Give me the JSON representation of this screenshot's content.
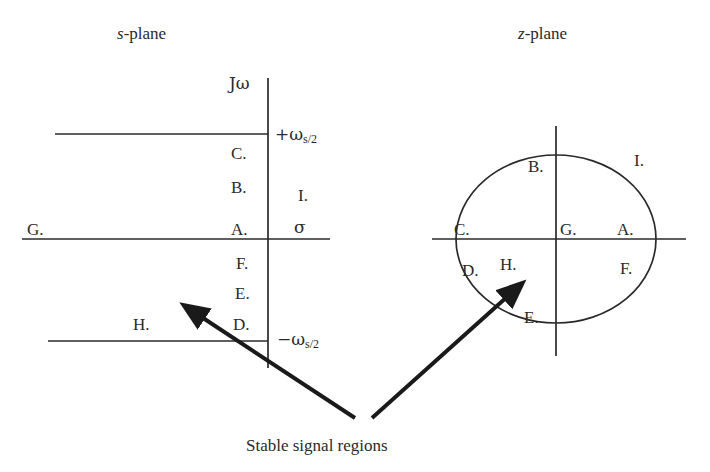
{
  "figure": {
    "caption": "Stable signal regions",
    "background_color": "#ffffff",
    "line_color": "#2a2a2a",
    "arrow_color": "#1a1a1a"
  },
  "s_plane": {
    "title_italic": "s",
    "title_rest": "-plane",
    "vertical_axis_label": "Jω",
    "horizontal_axis_label": "σ",
    "upper_line_label_prefix": "+ω",
    "upper_line_label_sub": "s/2",
    "lower_line_label_prefix": "−ω",
    "lower_line_label_sub": "s/2",
    "regions": [
      {
        "label": "C.",
        "x": 231,
        "y": 145
      },
      {
        "label": "B.",
        "x": 231,
        "y": 179
      },
      {
        "label": "A.",
        "x": 231,
        "y": 228
      },
      {
        "label": "F.",
        "x": 235,
        "y": 261
      },
      {
        "label": "E.",
        "x": 234,
        "y": 291
      },
      {
        "label": "D.",
        "x": 232,
        "y": 322
      },
      {
        "label": "G.",
        "x": 27,
        "y": 228
      },
      {
        "label": "H.",
        "x": 133,
        "y": 322
      },
      {
        "label": "I.",
        "x": 298,
        "y": 193
      }
    ]
  },
  "z_plane": {
    "title_italic": "z",
    "title_rest": "-plane",
    "regions": [
      {
        "label": "B.",
        "x": 528,
        "y": 164
      },
      {
        "label": "I.",
        "x": 634,
        "y": 158
      },
      {
        "label": "C.",
        "x": 454,
        "y": 227
      },
      {
        "label": "G.",
        "x": 558,
        "y": 227
      },
      {
        "label": "A.",
        "x": 617,
        "y": 227
      },
      {
        "label": "D.",
        "x": 462,
        "y": 268
      },
      {
        "label": "H.",
        "x": 500,
        "y": 262
      },
      {
        "label": "F.",
        "x": 620,
        "y": 266
      },
      {
        "label": "E.",
        "x": 524,
        "y": 315
      }
    ]
  }
}
